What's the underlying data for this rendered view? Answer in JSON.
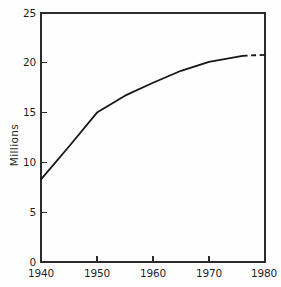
{
  "chart_data": {
    "type": "line",
    "title": "",
    "subtitle": "",
    "xlabel": "",
    "ylabel": "Millions",
    "xlim": [
      1940,
      1980
    ],
    "ylim": [
      0,
      25
    ],
    "grid": false,
    "legend": "none",
    "x_ticks": [
      1940,
      1950,
      1960,
      1970,
      1980
    ],
    "x_tick_labels": [
      "1940",
      "1950",
      "1960",
      "1970",
      "1980"
    ],
    "y_ticks": [
      0,
      5,
      10,
      15,
      20,
      25
    ],
    "y_tick_labels": [
      "0",
      "5",
      "10",
      "15",
      "20",
      "25"
    ],
    "x": [
      1940,
      1945,
      1950,
      1955,
      1960,
      1965,
      1970,
      1976,
      1980
    ],
    "values": [
      8.3,
      11.6,
      15.0,
      16.7,
      18.0,
      19.2,
      20.1,
      20.7,
      20.8
    ],
    "series": [
      {
        "name": "Millions",
        "x": [
          1940,
          1945,
          1950,
          1955,
          1960,
          1965,
          1970,
          1976,
          1980
        ],
        "values": [
          8.3,
          11.6,
          15.0,
          16.7,
          18.0,
          19.2,
          20.1,
          20.7,
          20.8
        ],
        "style": "solid-with-dashed-projection",
        "solid_until_x": 1976,
        "dashed_from_x": 1976,
        "color": "#161616"
      }
    ],
    "annotations": [
      "Line is solid from 1940 to about 1976 and dashed from about 1976 to 1980, indicating projected values.",
      "A distinct kink occurs at 1950 where the steep early rise changes to a gradual flattening."
    ]
  },
  "axes": {
    "y_title": "Millions",
    "y_tick_0": "0",
    "y_tick_1": "5",
    "y_tick_2": "10",
    "y_tick_3": "15",
    "y_tick_4": "20",
    "y_tick_5": "25",
    "x_tick_0": "1940",
    "x_tick_1": "1950",
    "x_tick_2": "1960",
    "x_tick_3": "1970",
    "x_tick_4": "1980"
  },
  "colors": {
    "background": "#fefefe",
    "axis": "#2b2b2b",
    "series": "#161616",
    "text": "#1f1f1f"
  }
}
